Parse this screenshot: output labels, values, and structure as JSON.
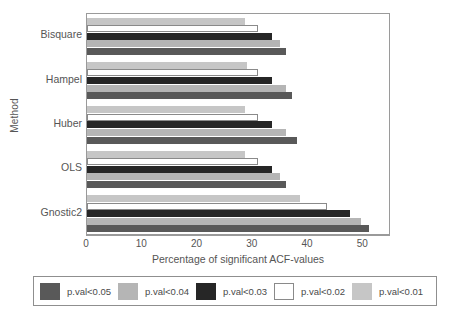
{
  "chart_data": {
    "type": "bar",
    "orientation": "horizontal",
    "title": "",
    "xlabel": "Percentage of significant ACF-values",
    "ylabel": "Method",
    "categories": [
      "Bisquare",
      "Hampel",
      "Huber",
      "OLS",
      "Gnostic2"
    ],
    "xlim": [
      0,
      55
    ],
    "xticks": [
      0,
      10,
      20,
      30,
      40,
      50
    ],
    "xtick_labels": [
      "0",
      "10",
      "20",
      "30",
      "40",
      "50"
    ],
    "grid": false,
    "legend_position": "bottom",
    "series": [
      {
        "name": "p.val<0.05",
        "color": "#595959",
        "values": [
          36.0,
          37.0,
          38.0,
          36.0,
          51.0
        ]
      },
      {
        "name": "p.val<0.04",
        "color": "#b5b5b5",
        "values": [
          35.0,
          36.0,
          36.0,
          35.0,
          49.5
        ]
      },
      {
        "name": "p.val<0.03",
        "color": "#262626",
        "values": [
          33.5,
          33.5,
          33.5,
          33.5,
          47.5
        ]
      },
      {
        "name": "p.val<0.02",
        "color": "#ffffff",
        "values": [
          31.0,
          31.0,
          31.0,
          31.0,
          43.5
        ]
      },
      {
        "name": "p.val<0.01",
        "color": "#c6c6c6",
        "values": [
          28.5,
          29.0,
          28.5,
          28.5,
          38.5
        ]
      }
    ]
  },
  "legend": {
    "entries": [
      {
        "label": "p.val<0.05",
        "color": "#595959"
      },
      {
        "label": "p.val<0.04",
        "color": "#b5b5b5"
      },
      {
        "label": "p.val<0.03",
        "color": "#262626"
      },
      {
        "label": "p.val<0.02",
        "color": "#ffffff"
      },
      {
        "label": "p.val<0.01",
        "color": "#c6c6c6"
      }
    ]
  }
}
